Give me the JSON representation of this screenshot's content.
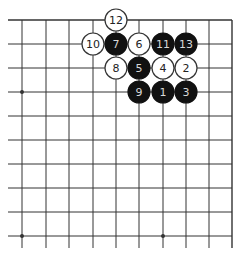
{
  "diagram": {
    "type": "go-board-fragment",
    "corner": "top-right",
    "columns": 10,
    "rows": 10,
    "grid_x": [
      22,
      46,
      69,
      93,
      116,
      139,
      163,
      186,
      209,
      232
    ],
    "grid_y": [
      20,
      44,
      68,
      92,
      116,
      140,
      164,
      188,
      212,
      236
    ],
    "edges": {
      "top": true,
      "right": true,
      "left": false,
      "bottom": false
    },
    "star_points": [
      {
        "col": 0,
        "row": 3
      },
      {
        "col": 0,
        "row": 9
      },
      {
        "col": 6,
        "row": 9
      }
    ],
    "stones": [
      {
        "move": "1",
        "color": "black",
        "col": 6,
        "row": 3
      },
      {
        "move": "2",
        "color": "white",
        "col": 7,
        "row": 2
      },
      {
        "move": "3",
        "color": "black",
        "col": 7,
        "row": 3
      },
      {
        "move": "4",
        "color": "white",
        "col": 6,
        "row": 2
      },
      {
        "move": "5",
        "color": "black",
        "col": 5,
        "row": 2
      },
      {
        "move": "6",
        "color": "white",
        "col": 5,
        "row": 1
      },
      {
        "move": "7",
        "color": "black",
        "col": 4,
        "row": 1
      },
      {
        "move": "8",
        "color": "white",
        "col": 4,
        "row": 2
      },
      {
        "move": "9",
        "color": "black",
        "col": 5,
        "row": 3
      },
      {
        "move": "10",
        "color": "white",
        "col": 3,
        "row": 1
      },
      {
        "move": "11",
        "color": "black",
        "col": 6,
        "row": 1
      },
      {
        "move": "12",
        "color": "white",
        "col": 4,
        "row": 0
      },
      {
        "move": "13",
        "color": "black",
        "col": 7,
        "row": 1
      }
    ],
    "colors": {
      "line": "#333333",
      "black_stone": "#111111",
      "black_label": "#d8d8d8",
      "white_stone": "#ffffff",
      "white_stroke": "#333333",
      "white_label": "#222222",
      "background": "#ffffff"
    }
  }
}
